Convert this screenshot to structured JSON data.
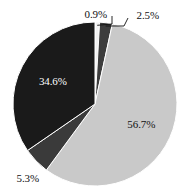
{
  "chart_data": {
    "type": "pie",
    "title": "",
    "subtitle": "",
    "xlabel": "",
    "ylabel": "",
    "legend": "none",
    "grid": false,
    "labels_position": "mixed-inside-and-outside-with-leader-lines",
    "start_angle_deg": 0,
    "direction": "clockwise",
    "categories": [
      "0.9%",
      "2.5%",
      "56.7%",
      "5.3%",
      "34.6%"
    ],
    "values": [
      0.9,
      2.5,
      56.7,
      5.3,
      34.6
    ],
    "slices": [
      {
        "label": "0.9%",
        "value": 0.9,
        "color": "#f2f2f2",
        "label_color": "#111111",
        "label_placement": "outside-top",
        "has_leader_line": true
      },
      {
        "label": "2.5%",
        "value": 2.5,
        "color": "#3d3d3d",
        "label_color": "#111111",
        "label_placement": "outside-top-right",
        "has_leader_line": true
      },
      {
        "label": "56.7%",
        "value": 56.7,
        "color": "#c9c9c9",
        "label_color": "#111111",
        "label_placement": "inside-right",
        "has_leader_line": false
      },
      {
        "label": "5.3%",
        "value": 5.3,
        "color": "#3a3a3a",
        "label_color": "#111111",
        "label_placement": "outside-bottom-left",
        "has_leader_line": false
      },
      {
        "label": "34.6%",
        "value": 34.6,
        "color": "#1a1a1a",
        "label_color": "#ffffff",
        "label_placement": "inside-left",
        "has_leader_line": false
      }
    ],
    "geometry": {
      "center_x": 95,
      "center_y": 104,
      "radius": 82
    },
    "background_color": "#ffffff"
  }
}
